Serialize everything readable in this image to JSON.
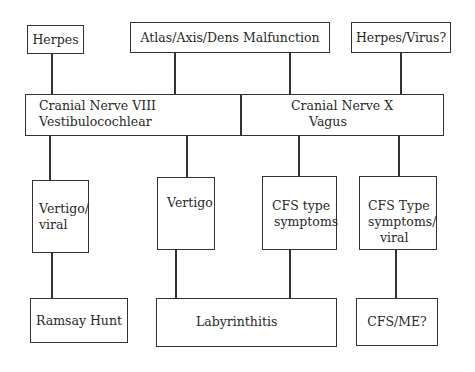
{
  "diagram": {
    "top_row": {
      "herpes": "Herpes",
      "atlas": "Atlas/Axis/Dens Malfunction",
      "herpes_virus": "Herpes/Virus?"
    },
    "nerve_band": {
      "left_line1": "Cranial Nerve VIII",
      "left_line2": "Vestibulocochlear",
      "right_line1": "Cranial Nerve X",
      "right_line2": "Vagus"
    },
    "middle_row": {
      "vertigo_viral_line1": "Vertigo/",
      "vertigo_viral_line2": "viral",
      "vertigo": "Vertigo",
      "cfs_type_line1": "CFS type",
      "cfs_type_line2": "symptoms",
      "cfs_type_viral_line1": "CFS Type",
      "cfs_type_viral_line2": "symptoms/",
      "cfs_type_viral_line3": "viral"
    },
    "bottom_row": {
      "ramsay_hunt": "Ramsay Hunt",
      "labyrinthitis": "Labyrinthitis",
      "cfs_me": "CFS/ME?"
    },
    "colors": {
      "line": "#333333",
      "background": "#ffffff",
      "text": "#2a2a2a"
    }
  }
}
